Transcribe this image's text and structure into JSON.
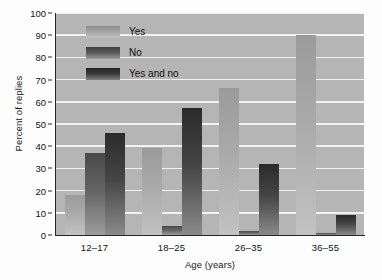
{
  "chart_data": {
    "type": "bar",
    "title": "",
    "subtitle": "",
    "xlabel": "Age (years)",
    "ylabel": "Percent of replies",
    "categories": [
      "12–17",
      "18–25",
      "26–35",
      "36–55"
    ],
    "series": [
      {
        "name": "Yes",
        "values": [
          18,
          39,
          66,
          90
        ],
        "color": "#a8a8a8"
      },
      {
        "name": "No",
        "values": [
          37,
          4,
          2,
          1
        ],
        "color": "#636363"
      },
      {
        "name": "Yes and no",
        "values": [
          46,
          57,
          32,
          9
        ],
        "color": "#3a3a3a"
      }
    ],
    "ylim": [
      0,
      100
    ],
    "ytick_labels": [
      "0",
      "10",
      "20",
      "30",
      "40",
      "50",
      "60",
      "70",
      "80",
      "90",
      "100"
    ],
    "ytick_values": [
      0,
      10,
      20,
      30,
      40,
      50,
      60,
      70,
      80,
      90,
      100
    ],
    "grid": true,
    "grid_axis": "y",
    "grid_color": "#f2f2f2",
    "legend_position": "upper-left-inside",
    "plot_background": "#b5b5b5",
    "figure_background": "#fdfdfd",
    "axis_color": "#262626",
    "grouped": true
  }
}
